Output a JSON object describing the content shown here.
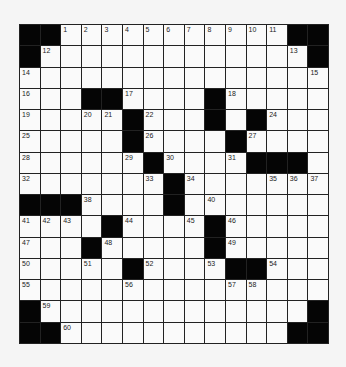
{
  "puzzle": {
    "rows": 15,
    "cols": 15,
    "grid": [
      "##...........##",
      "#.............#",
      "...............",
      "...##....#.....",
      ".....#...#.#...",
      ".....#....#....",
      "......#....###.",
      ".......#.......",
      "###....#.......",
      "....#....#.....",
      "...#.....#.....",
      ".....#....##...",
      "...............",
      "#.............#",
      "##...........##"
    ],
    "numbers": {
      "0,2": "1",
      "0,3": "2",
      "0,4": "3",
      "0,5": "4",
      "0,6": "5",
      "0,7": "6",
      "0,8": "7",
      "0,9": "8",
      "0,10": "9",
      "0,11": "10",
      "0,12": "11",
      "1,1": "12",
      "1,13": "13",
      "2,0": "14",
      "2,14": "15",
      "3,0": "16",
      "3,5": "17",
      "3,10": "18",
      "4,0": "19",
      "4,3": "20",
      "4,4": "21",
      "4,6": "22",
      "4,9": "23",
      "4,12": "24",
      "5,0": "25",
      "5,6": "26",
      "5,11": "27",
      "6,0": "28",
      "6,5": "29",
      "6,7": "30",
      "6,10": "31",
      "7,0": "32",
      "7,6": "33",
      "7,8": "34",
      "7,12": "35",
      "7,13": "36",
      "7,14": "37",
      "8,3": "38",
      "8,7": "39",
      "8,9": "40",
      "9,0": "41",
      "9,1": "42",
      "9,2": "43",
      "9,5": "44",
      "9,8": "45",
      "9,10": "46",
      "10,0": "47",
      "10,4": "48",
      "10,10": "49",
      "11,0": "50",
      "11,3": "51",
      "11,6": "52",
      "11,9": "53",
      "11,12": "54",
      "12,0": "55",
      "12,5": "56",
      "12,10": "57",
      "12,11": "58",
      "13,1": "59",
      "14,2": "60"
    }
  },
  "colors": {
    "block": "#050505",
    "cell": "#fafafa",
    "line": "#222222"
  }
}
